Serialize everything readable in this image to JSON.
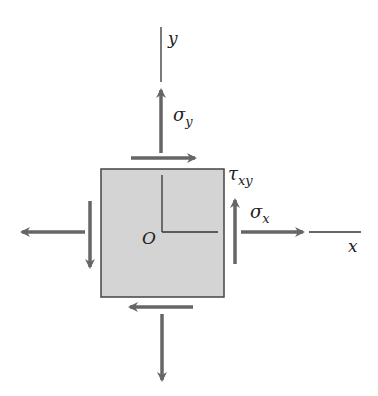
{
  "diagram": {
    "type": "plane-stress-element",
    "colors": {
      "element_fill": "#d4d4d4",
      "element_stroke": "#444444",
      "arrow": "#666666",
      "axis": "#333333"
    },
    "labels": {
      "y_axis": "y",
      "x_axis": "x",
      "origin": "O",
      "sigma_y": {
        "base": "σ",
        "sub": "y"
      },
      "sigma_x": {
        "base": "σ",
        "sub": "x"
      },
      "tau_xy": {
        "base": "τ",
        "sub": "xy"
      }
    }
  }
}
